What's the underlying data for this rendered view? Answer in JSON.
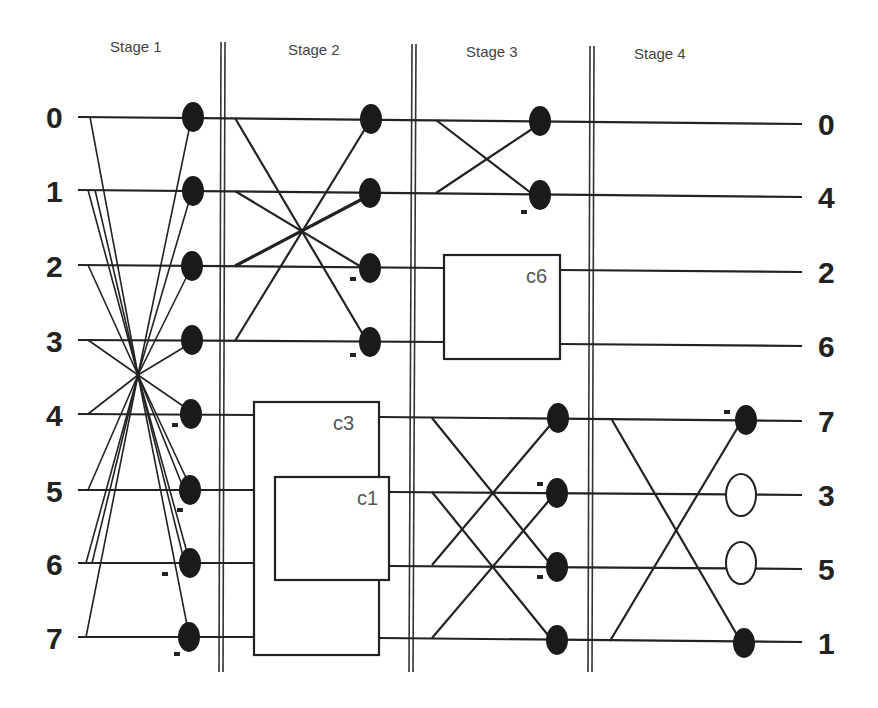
{
  "diagram": {
    "stages": [
      {
        "label": "Stage 1"
      },
      {
        "label": "Stage 2"
      },
      {
        "label": "Stage 3"
      },
      {
        "label": "Stage 4"
      }
    ],
    "inputs": [
      "0",
      "1",
      "2",
      "3",
      "4",
      "5",
      "6",
      "7"
    ],
    "outputs": [
      "0",
      "4",
      "2",
      "6",
      "7",
      "3",
      "5",
      "1"
    ],
    "boxes": [
      {
        "id": "c3",
        "label": "c3",
        "stage": 2
      },
      {
        "id": "c1",
        "label": "c1",
        "stage": 2
      },
      {
        "id": "c6",
        "label": "c6",
        "stage": 3
      }
    ],
    "minus_sign": "-",
    "colors": {
      "line": "#222222",
      "node_fill": "#1a1a1a",
      "background": "#ffffff"
    }
  }
}
